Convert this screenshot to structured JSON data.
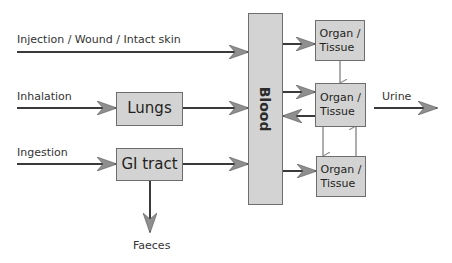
{
  "diagram": {
    "inputs": {
      "injection": "Injection / Wound / Intact skin",
      "inhalation": "Inhalation",
      "ingestion": "Ingestion"
    },
    "nodes": {
      "lungs": "Lungs",
      "gi_tract": "GI tract",
      "blood": "Blood",
      "organ1": "Organ /\nTissue",
      "organ2": "Organ /\nTissue",
      "organ3": "Organ /\nTissue"
    },
    "outputs": {
      "urine": "Urine",
      "faeces": "Faeces"
    },
    "colors": {
      "box_fill": "#d3d3d3",
      "box_border": "#6d6d6d",
      "line": "#3a3a3a",
      "arrowhead": "#8a8a8a"
    }
  }
}
